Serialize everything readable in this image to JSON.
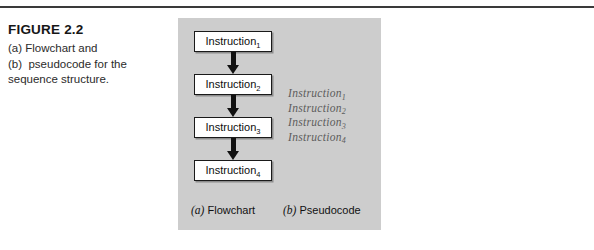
{
  "figure": {
    "number": "FIGURE 2.2",
    "caption_lines": [
      "(a) Flowchart and",
      "(b)  pseudocode for the",
      "sequence structure."
    ],
    "caption_full": "(a) Flowchart and (b) pseudocode for the sequence structure."
  },
  "flowchart": {
    "nodes": [
      {
        "text": "Instruction",
        "subscript": "1"
      },
      {
        "text": "Instruction",
        "subscript": "2"
      },
      {
        "text": "Instruction",
        "subscript": "3"
      },
      {
        "text": "Instruction",
        "subscript": "4"
      }
    ],
    "arrow_count": 3,
    "label_tag": "(a)",
    "label_text": " Flowchart"
  },
  "pseudocode": {
    "lines": [
      {
        "text": "Instruction",
        "subscript": "1"
      },
      {
        "text": "Instruction",
        "subscript": "2"
      },
      {
        "text": "Instruction",
        "subscript": "3"
      },
      {
        "text": "Instruction",
        "subscript": "4"
      }
    ],
    "label_tag": "(b)",
    "label_text": " Pseudocode"
  },
  "colors": {
    "panel_background": "#cdcdcd",
    "node_fill": "#ffffff",
    "node_border": "#1a1a1a",
    "arrow": "#111111",
    "pseudocode_text": "#5c5c5c",
    "rule": "#3a3a3a",
    "page_background": "#ffffff"
  }
}
